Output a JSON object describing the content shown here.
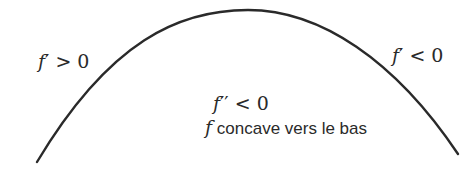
{
  "diagram": {
    "curve": {
      "shape": "concave-down arc",
      "color": "#2a2a2a",
      "start": [
        37,
        162
      ],
      "peak": [
        248,
        10
      ],
      "end": [
        458,
        154
      ]
    },
    "left_label": {
      "fn": "f",
      "prime": "′",
      "rel": " > 0"
    },
    "right_label": {
      "fn": "f",
      "prime": "′",
      "rel": " < 0"
    },
    "center_label": {
      "fn": "f",
      "prime": "′′",
      "rel": " < 0"
    },
    "caption": {
      "fn": "f",
      "text": " concave vers le bas"
    }
  }
}
